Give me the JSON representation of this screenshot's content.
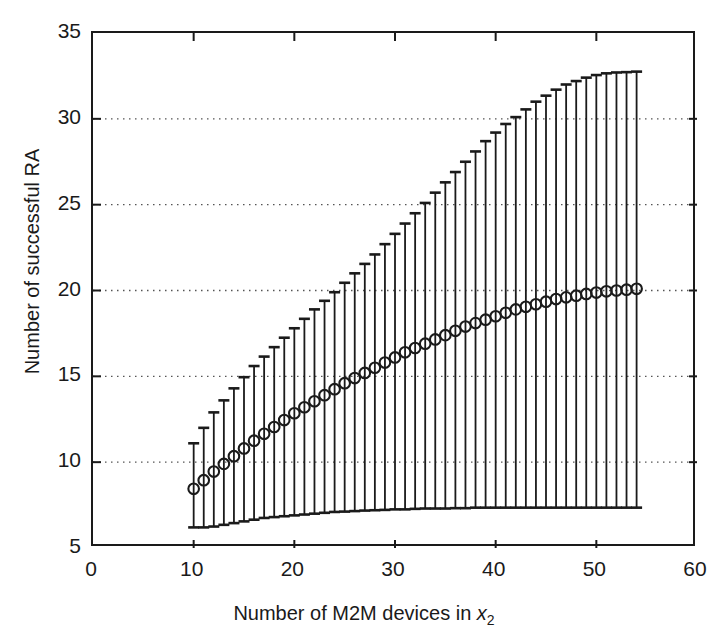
{
  "chart_data": {
    "type": "line",
    "title": "",
    "subtitle": "",
    "xlabel": "Number of M2M devices in x2",
    "xlabel_parts": {
      "text": "Number of M2M devices in ",
      "var": "x",
      "sub": "2"
    },
    "ylabel": "Number of successful RA",
    "xlim": [
      0,
      60
    ],
    "ylim": [
      5,
      35
    ],
    "xticks": [
      0,
      10,
      20,
      30,
      40,
      50,
      60
    ],
    "yticks": [
      5,
      10,
      15,
      20,
      25,
      30,
      35
    ],
    "xticklabels": [
      "0",
      "10",
      "20",
      "30",
      "40",
      "50",
      "60"
    ],
    "yticklabels": [
      "5",
      "10",
      "15",
      "20",
      "25",
      "30",
      "35"
    ],
    "grid": "horizontal-dotted",
    "gridlines_y": [
      10,
      15,
      20,
      25,
      30
    ],
    "legend": null,
    "marker": "open-circle",
    "errorbar": "vertical-with-caps",
    "series_color": "#1a1a1a",
    "x": [
      10,
      11,
      12,
      13,
      14,
      15,
      16,
      17,
      18,
      19,
      20,
      21,
      22,
      23,
      24,
      25,
      26,
      27,
      28,
      29,
      30,
      31,
      32,
      33,
      34,
      35,
      36,
      37,
      38,
      39,
      40,
      41,
      42,
      43,
      44,
      45,
      46,
      47,
      48,
      49,
      50,
      51,
      52,
      53,
      54
    ],
    "mean": [
      8.45,
      8.95,
      9.45,
      9.9,
      10.35,
      10.8,
      11.25,
      11.65,
      12.05,
      12.45,
      12.85,
      13.2,
      13.55,
      13.9,
      14.25,
      14.6,
      14.9,
      15.2,
      15.5,
      15.8,
      16.1,
      16.4,
      16.65,
      16.9,
      17.15,
      17.4,
      17.65,
      17.9,
      18.1,
      18.3,
      18.5,
      18.7,
      18.9,
      19.05,
      19.2,
      19.35,
      19.5,
      19.6,
      19.7,
      19.8,
      19.88,
      19.95,
      20.0,
      20.05,
      20.1
    ],
    "upper": [
      11.1,
      12.0,
      12.9,
      13.6,
      14.3,
      14.95,
      15.6,
      16.15,
      16.7,
      17.25,
      17.8,
      18.35,
      18.9,
      19.4,
      19.9,
      20.45,
      21.0,
      21.55,
      22.1,
      22.7,
      23.3,
      23.9,
      24.5,
      25.1,
      25.7,
      26.3,
      26.9,
      27.5,
      28.1,
      28.7,
      29.2,
      29.7,
      30.1,
      30.55,
      31.0,
      31.35,
      31.7,
      32.0,
      32.2,
      32.4,
      32.55,
      32.65,
      32.7,
      32.72,
      32.75
    ],
    "lower": [
      6.2,
      6.2,
      6.25,
      6.35,
      6.45,
      6.55,
      6.65,
      6.75,
      6.8,
      6.85,
      6.9,
      6.95,
      7.0,
      7.05,
      7.1,
      7.12,
      7.15,
      7.18,
      7.2,
      7.22,
      7.25,
      7.25,
      7.28,
      7.3,
      7.3,
      7.3,
      7.32,
      7.32,
      7.35,
      7.35,
      7.35,
      7.35,
      7.35,
      7.35,
      7.35,
      7.35,
      7.35,
      7.35,
      7.35,
      7.35,
      7.35,
      7.35,
      7.35,
      7.35,
      7.35
    ]
  },
  "axis": {
    "x_title": "Number of M2M devices in ",
    "x_var": "x",
    "x_sub": "2",
    "y_title": "Number of successful RA"
  }
}
